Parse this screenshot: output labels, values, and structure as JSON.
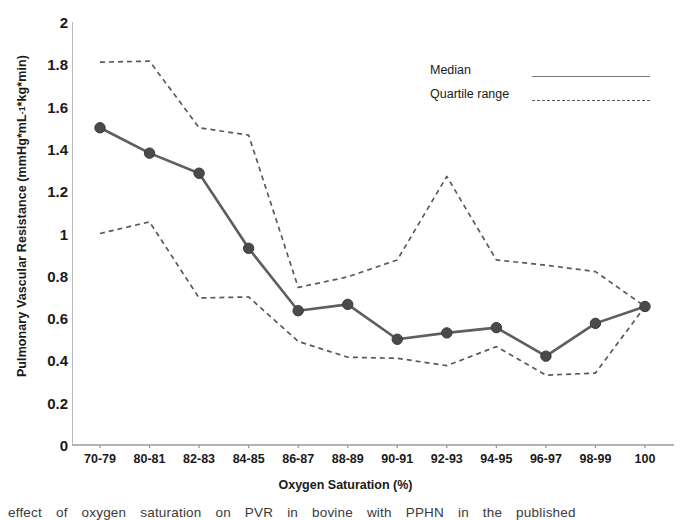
{
  "chart_data": {
    "type": "line",
    "title": "",
    "xlabel": "Oxygen Saturation (%)",
    "ylabel": "Pulmonary Vascular Resistance (mmHg*mL",
    "ylabel_sup": "-1",
    "ylabel_tail": "*kg*min)",
    "categories": [
      "70-79",
      "80-81",
      "82-83",
      "84-85",
      "86-87",
      "88-89",
      "90-91",
      "92-93",
      "94-95",
      "96-97",
      "98-99",
      "100"
    ],
    "ylim": [
      0,
      2
    ],
    "yticks": [
      "2",
      "1.8",
      "1.6",
      "1.4",
      "1.2",
      "1",
      "0.8",
      "0.6",
      "0.4",
      "0.2",
      "0"
    ],
    "ytick_values": [
      2,
      1.8,
      1.6,
      1.4,
      1.2,
      1,
      0.8,
      0.6,
      0.4,
      0.2,
      0
    ],
    "grid": false,
    "legend_position": "top-right",
    "series": [
      {
        "name": "Median",
        "style": "solid",
        "marker": "circle",
        "color": "#5e5e5e",
        "values": [
          1.5,
          1.38,
          1.285,
          0.93,
          0.635,
          0.665,
          0.5,
          0.53,
          0.555,
          0.42,
          0.575,
          0.655
        ]
      },
      {
        "name": "Upper quartile",
        "style": "dashed",
        "marker": "none",
        "color": "#5a5a5a",
        "values": [
          1.81,
          1.815,
          1.5,
          1.465,
          0.745,
          0.795,
          0.875,
          1.27,
          0.875,
          0.85,
          0.82,
          0.655
        ]
      },
      {
        "name": "Lower quartile",
        "style": "dashed",
        "marker": "none",
        "color": "#5a5a5a",
        "values": [
          1.0,
          1.055,
          0.695,
          0.7,
          0.49,
          0.415,
          0.41,
          0.375,
          0.465,
          0.33,
          0.34,
          0.655
        ]
      }
    ]
  },
  "legend": {
    "median_label": "Median",
    "quartile_label": "Quartile range"
  },
  "colors": {
    "axis": "#9a9a9a",
    "median_line": "#5e5e5e",
    "marker_fill": "#4a4a4a",
    "quartile_line": "#5a5a5a",
    "text": "#1a1a1a",
    "background": "#ffffff"
  },
  "caption": {
    "text": "effect of oxygen saturation on PVR in bovine with PPHN in the published"
  }
}
